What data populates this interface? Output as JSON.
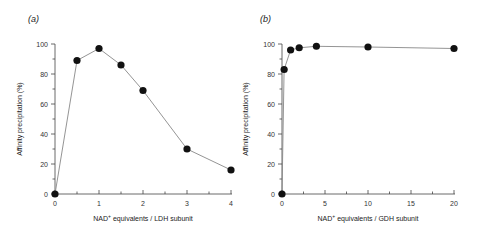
{
  "chart_data": [
    {
      "type": "line",
      "panel_label": "(a)",
      "title": "",
      "xlabel": "NAD+ equivalents / LDH subunit",
      "xlabel_main": "NAD",
      "xlabel_sup": "+",
      "xlabel_rest": " equivalents / LDH subunit",
      "ylabel": "Affinity precipitation (%)",
      "xlim": [
        0,
        4
      ],
      "ylim": [
        0,
        100
      ],
      "xticks": [
        0,
        1,
        2,
        3,
        4
      ],
      "yticks": [
        0,
        20,
        40,
        60,
        80,
        100
      ],
      "grid": false,
      "series": [
        {
          "name": "LDH",
          "x": [
            0,
            0.5,
            1,
            1.5,
            2,
            3,
            4
          ],
          "y": [
            0,
            89,
            97,
            86,
            69,
            30,
            16
          ]
        }
      ]
    },
    {
      "type": "line",
      "panel_label": "(b)",
      "title": "",
      "xlabel": "NAD+ equivalents / GDH subunit",
      "xlabel_main": "NAD",
      "xlabel_sup": "+",
      "xlabel_rest": " equivalents / GDH subunit",
      "ylabel": "Affinity precipitation (%)",
      "xlim": [
        0,
        20
      ],
      "ylim": [
        0,
        100
      ],
      "xticks": [
        0,
        5,
        10,
        15,
        20
      ],
      "yticks": [
        0,
        20,
        40,
        60,
        80,
        100
      ],
      "grid": false,
      "series": [
        {
          "name": "GDH",
          "x": [
            0,
            0.25,
            1,
            2,
            4,
            10,
            20
          ],
          "y": [
            0,
            83,
            96,
            97.5,
            98.5,
            98,
            97
          ]
        }
      ]
    }
  ]
}
